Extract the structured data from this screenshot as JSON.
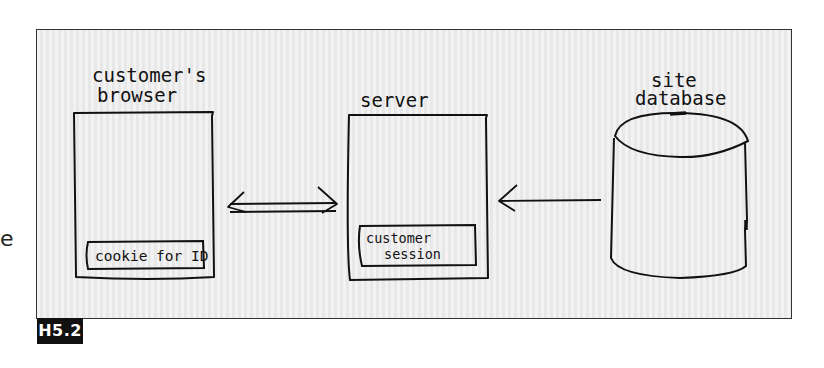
{
  "figure": {
    "label": "H5.2",
    "stray_text": "e"
  },
  "nodes": {
    "browser": {
      "title_line1": "customer's",
      "title_line2": "browser",
      "inner_label": "cookie for ID"
    },
    "server": {
      "title": "server",
      "inner_label_line1": "customer",
      "inner_label_line2": "session"
    },
    "database": {
      "title_line1": "site",
      "title_line2": "database"
    }
  },
  "edges": [
    {
      "from": "browser",
      "to": "server",
      "direction": "bidirectional"
    },
    {
      "from": "database",
      "to": "server",
      "direction": "one-way"
    }
  ],
  "colors": {
    "ink": "#111111",
    "panel": "#ececec",
    "label_bg": "#111111",
    "label_fg": "#ffffff"
  }
}
